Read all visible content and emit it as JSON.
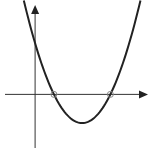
{
  "chart_data": {
    "type": "line",
    "title": "",
    "xlabel": "",
    "ylabel": "",
    "function": "y = (x - 1)(x - 4)",
    "xlim": [
      -1.6,
      6.0
    ],
    "ylim": [
      -4.2,
      7.0
    ],
    "grid": false,
    "legend": "none",
    "roots": [
      1,
      4
    ],
    "vertex": [
      2.5,
      -2.25
    ],
    "y_intercept": 4,
    "x_range_plotted": [
      -0.6,
      5.6
    ],
    "colors": {
      "curve": "#222222",
      "axes": "#333333",
      "marker": "#888888"
    }
  }
}
